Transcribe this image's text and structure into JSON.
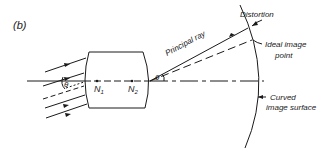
{
  "figure": {
    "panel_label": "(b)",
    "labels": {
      "distortion": "Distortion",
      "ideal_image_line1": "Ideal  image",
      "ideal_image_line2": "point",
      "curved_line1": "Curved",
      "curved_line2": "image  surface",
      "principal_ray": "Principal  ray",
      "n1": "N",
      "n1_sub": "1",
      "n2": "N",
      "n2_sub": "2",
      "theta_in": "θ",
      "theta_out": "θ"
    },
    "colors": {
      "ink": "#1a1a1a",
      "background": "#ffffff"
    }
  }
}
